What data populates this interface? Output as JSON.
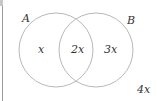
{
  "diagram": {
    "type": "venn",
    "sets": [
      {
        "name": "A",
        "label": "A",
        "cx": 56,
        "cy": 50,
        "r": 37
      },
      {
        "name": "B",
        "label": "B",
        "cx": 96,
        "cy": 50,
        "r": 37
      }
    ],
    "regions": {
      "a_only": "x",
      "intersection": "2x",
      "b_only": "3x",
      "outside": "4x"
    },
    "colors": {
      "circle_stroke": "#b8b8b8",
      "text": "#333333"
    }
  }
}
